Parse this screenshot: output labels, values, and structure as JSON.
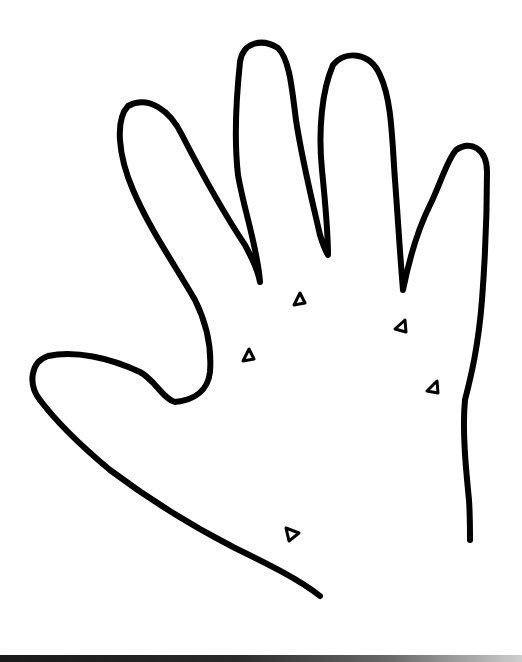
{
  "figure": {
    "stroke_color": "#000000",
    "background_color": "#ffffff",
    "markers": [
      {
        "id": 1,
        "shape": "triangle",
        "x": 300,
        "y": 300
      },
      {
        "id": 2,
        "shape": "triangle",
        "x": 401,
        "y": 327
      },
      {
        "id": 3,
        "shape": "triangle",
        "x": 249,
        "y": 356
      },
      {
        "id": 4,
        "shape": "triangle",
        "x": 433,
        "y": 388
      },
      {
        "id": 5,
        "shape": "triangle",
        "x": 292,
        "y": 535
      }
    ]
  }
}
